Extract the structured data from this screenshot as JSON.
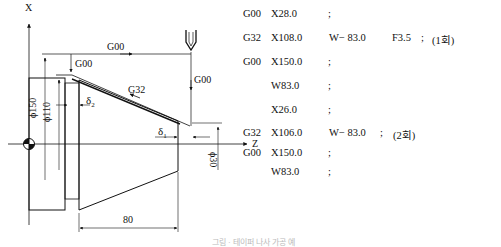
{
  "diagram": {
    "axes": {
      "x_label": "X",
      "z_label": "Z"
    },
    "motion_labels": {
      "rapid_top": "G00",
      "rapid_down_left": "G00",
      "rapid_down_right": "G00",
      "thread_cut": "G32"
    },
    "dimensions": {
      "dia_150": "ϕ150",
      "dia_110": "ϕ110",
      "dia_30": "ϕ30",
      "length_80": "80",
      "delta_1": "δ",
      "delta_1_sub": "1",
      "delta_2": "δ",
      "delta_2_sub": "2"
    }
  },
  "program": {
    "lines": [
      {
        "g": "G00",
        "a": "X28.0",
        "b": "",
        "c": "",
        "end": ";",
        "note": ""
      },
      {
        "g": "G32",
        "a": "X108.0",
        "b": "W− 83.0",
        "c": "F3.5",
        "end": ";",
        "note": "(1회)"
      },
      {
        "g": "G00",
        "a": "X150.0",
        "b": "",
        "c": "",
        "end": ";",
        "note": ""
      },
      {
        "g": "",
        "a": "W83.0",
        "b": "",
        "c": "",
        "end": ";",
        "note": ""
      },
      {
        "g": "",
        "a": "X26.0",
        "b": "",
        "c": "",
        "end": ";",
        "note": ""
      },
      {
        "g": "G32",
        "a": "X106.0",
        "b": "W− 83.0",
        "c": "",
        "end": ";",
        "note": "(2회)"
      },
      {
        "g": "G00",
        "a": "X150.0",
        "b": "",
        "c": "",
        "end": ";",
        "note": ""
      },
      {
        "g": "",
        "a": "W83.0",
        "b": "",
        "c": "",
        "end": ";",
        "note": ""
      }
    ]
  },
  "caption": "그림 · 테이퍼 나사 가공 예"
}
